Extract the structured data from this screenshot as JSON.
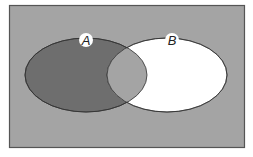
{
  "diagram": {
    "type": "venn",
    "universe": {
      "fill": "#a4a4a4",
      "stroke": "#555555"
    },
    "sets": [
      {
        "label": "A",
        "fill": "#6e6e6e",
        "shaded": true
      },
      {
        "label": "B",
        "fill": "#ffffff",
        "shaded": false
      }
    ],
    "intersection_fill": "#a4a4a4",
    "shaded_region": "A only (A minus B)"
  }
}
